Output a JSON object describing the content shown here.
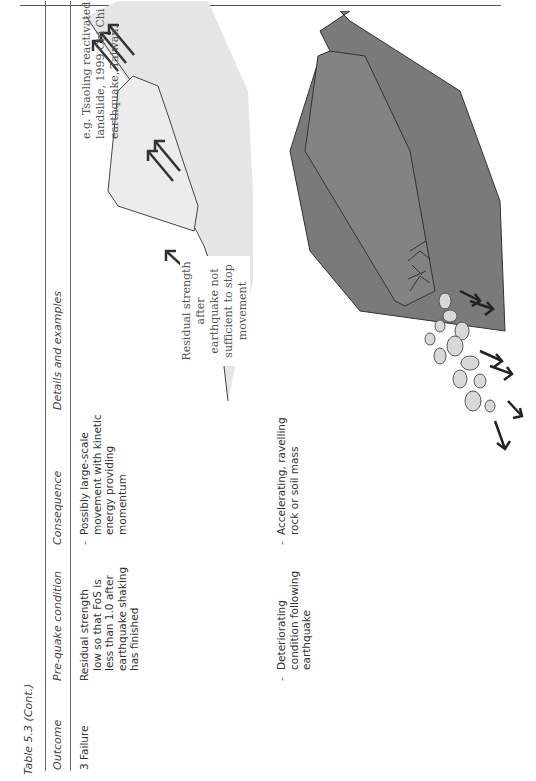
{
  "document": {
    "caption": "Table 5.3 (Cont.)",
    "columns": [
      "Outcome",
      "Pre-quake condition",
      "Consequence",
      "Details and examples"
    ],
    "rows": [
      {
        "outcome": "3  Failure",
        "pre_quake_condition": "Residual strength low so that FoS is less than 1.0 after earthquake shaking has finished",
        "pre_quake_lines": [
          "Residual strength",
          "low so that FoS is",
          "less than 1.0 after",
          "earthquake shaking",
          "has finished"
        ],
        "consequence_bullet": "-",
        "consequence_lines": [
          "Possibly large-scale",
          "movement with kinetic",
          "energy providing",
          "momentum"
        ],
        "details": {
          "example_lines": [
            "e.g. Tsaoling reactivated",
            "landslide, 1999 Chi Chi",
            "earthquake, Taiwan."
          ],
          "diagram_label_lines": [
            "Residual strength after",
            "earthquake not",
            "sufficient to stop",
            "movement"
          ],
          "diagram": "reactivated-landslide-sketch"
        }
      },
      {
        "outcome": "",
        "pre_quake_bullet": "-",
        "pre_quake_lines": [
          "Deteriorating",
          "condition following",
          "earthquake"
        ],
        "consequence_bullet": "-",
        "consequence_lines": [
          "Accelerating, ravelling",
          "rock or soil mass"
        ],
        "details": {
          "diagram": "ravelling-rock-slope-sketch"
        }
      }
    ]
  },
  "colors": {
    "slide_fill": "#e6e6e6",
    "rock_fill": "#7a7a7a",
    "debris_fill": "#d8d8d8",
    "line": "#333333"
  }
}
